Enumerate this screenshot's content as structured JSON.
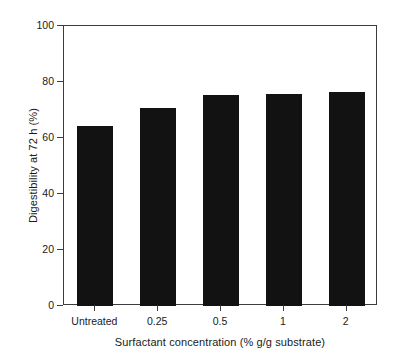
{
  "chart_data": {
    "type": "bar",
    "title": "",
    "subtitle": "",
    "xlabel": "Surfactant concentration (% g/g substrate)",
    "ylabel": "Digestibility at 72 h (%)",
    "categories": [
      "Untreated",
      "0.25",
      "0.5",
      "1",
      "2"
    ],
    "values": [
      64.3,
      70.8,
      75.5,
      75.8,
      76.5
    ],
    "series": [
      {
        "name": "Digestibility at 72 h",
        "values": [
          64.3,
          70.8,
          75.5,
          75.8,
          76.5
        ]
      }
    ],
    "ylim": [
      0,
      100
    ],
    "yticks": [
      0,
      20,
      40,
      60,
      80,
      100
    ],
    "ytick_labels": [
      "0",
      "20",
      "40",
      "60",
      "80",
      "100"
    ],
    "xtick_labels": [
      "Untreated",
      "0.25",
      "0.5",
      "1",
      "2"
    ],
    "grid": false,
    "legend": null,
    "legend_position": "none",
    "bar_color": "#121212",
    "axis_color": "#3c3c3c",
    "background_color": "#ffffff",
    "annotations": []
  }
}
